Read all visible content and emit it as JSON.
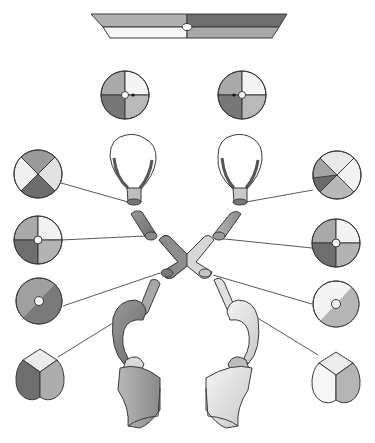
{
  "diagram": {
    "type": "visual-pathway-illustration",
    "text_labels": [],
    "colors": {
      "background": "#ffffff",
      "outline": "#3a3a3a",
      "dark": "#6e6e6e",
      "mid_dark": "#8c8c8c",
      "mid": "#a8a8a8",
      "light": "#cfcfcf",
      "very_light": "#ececec",
      "white": "#f8f8f8"
    },
    "visual_field_bar": {
      "quadrants": {
        "upper_left": "mid",
        "upper_right": "dark",
        "lower_left": "white",
        "lower_right": "mid"
      }
    },
    "eye_fields": [
      {
        "side": "left",
        "quadrants": [
          "mid",
          "white",
          "mid",
          "dark"
        ],
        "dot": "right"
      },
      {
        "side": "right",
        "quadrants": [
          "mid",
          "white",
          "mid",
          "dark"
        ],
        "dot": "left"
      }
    ],
    "left_side_field_diagrams": [
      {
        "shape": "circle",
        "pattern": "x-sectors",
        "level": "optic-nerve"
      },
      {
        "shape": "circle",
        "pattern": "quadrants-with-center",
        "level": "optic-nerve-distal"
      },
      {
        "shape": "circle",
        "pattern": "diagonal-half-with-center",
        "level": "optic-tract"
      },
      {
        "shape": "heart",
        "pattern": "three-sectors",
        "level": "lateral-geniculate"
      }
    ],
    "right_side_field_diagrams": [
      {
        "shape": "circle",
        "pattern": "x-sectors",
        "level": "optic-nerve"
      },
      {
        "shape": "circle",
        "pattern": "quadrants-with-center",
        "level": "optic-nerve-distal"
      },
      {
        "shape": "circle",
        "pattern": "diagonal-half-with-center",
        "level": "optic-tract"
      },
      {
        "shape": "heart",
        "pattern": "three-sectors",
        "level": "lateral-geniculate"
      }
    ]
  }
}
